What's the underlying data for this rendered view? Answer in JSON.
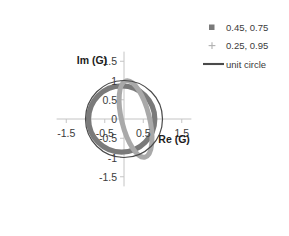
{
  "chart_data": {
    "type": "line",
    "title": "",
    "xlabel": "Re (G)",
    "ylabel": "Im (G)",
    "xlim": [
      -1.75,
      1.75
    ],
    "ylim": [
      -1.75,
      1.75
    ],
    "grid": false,
    "xticks": [
      "-1.5",
      "-0.5",
      "0.5",
      "1.5"
    ],
    "xtick_values": [
      -1.5,
      -0.5,
      0.5,
      1.5
    ],
    "yticks": [
      "1.5",
      "1",
      "0.5",
      "0",
      "-0.5",
      "-1",
      "-1.5"
    ],
    "ytick_values": [
      1.5,
      1,
      0.5,
      0,
      -0.5,
      -1,
      -1.5
    ],
    "legend_position": "top-right",
    "series": [
      {
        "name": "0.45, 0.75",
        "marker": "square",
        "color": "#7a7a7a",
        "linewidth": 5.2,
        "geometry": {
          "shape": "circle",
          "cx": -0.06,
          "cy": 0.0,
          "r": 0.86
        }
      },
      {
        "name": "0.25, 0.95",
        "marker": "plus",
        "color": "#a9a9a9",
        "linewidth": 5.0,
        "geometry": {
          "shape": "ellipse",
          "cx": 0.3,
          "cy": 0.0,
          "rx": 0.36,
          "ry": 1.02,
          "rotation": -14
        }
      },
      {
        "name": "unit circle",
        "marker": "line",
        "color": "#4a4a4a",
        "linewidth": 1.2,
        "geometry": {
          "shape": "circle",
          "cx": 0.0,
          "cy": 0.0,
          "r": 1.0
        }
      }
    ]
  },
  "axes": {
    "x_title": "Re (G)",
    "y_title": "Im (G)",
    "x_tick_labels": [
      "-1.5",
      "-0.5",
      "0.5",
      "1.5"
    ],
    "y_tick_labels": [
      "1.5",
      "1",
      "0.5",
      "0",
      "-0.5",
      "-1",
      "-1.5"
    ]
  },
  "legend": {
    "entries": [
      {
        "label": "0.45, 0.75",
        "marker": "square-marker",
        "color": "#7a7a7a"
      },
      {
        "label": "0.25, 0.95",
        "marker": "plus-marker",
        "color": "#a9a9a9"
      },
      {
        "label": "unit circle",
        "marker": "line-marker",
        "color": "#4a4a4a"
      }
    ]
  },
  "colors": {
    "axis": "#c4c4c4",
    "text": "#3b3b3b",
    "series_dark": "#7a7a7a",
    "series_light": "#a9a9a9",
    "unit_circle": "#4a4a4a",
    "background": "#ffffff"
  }
}
